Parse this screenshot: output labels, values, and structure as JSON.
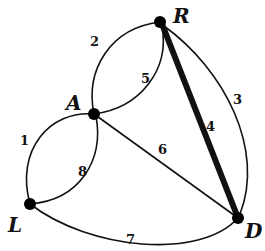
{
  "graph": {
    "nodes": [
      {
        "id": "R",
        "label": "R"
      },
      {
        "id": "A",
        "label": "A"
      },
      {
        "id": "L",
        "label": "L"
      },
      {
        "id": "D",
        "label": "D"
      }
    ],
    "edges": [
      {
        "id": "e1",
        "label": "1",
        "from": "A",
        "to": "L"
      },
      {
        "id": "e2",
        "label": "2",
        "from": "A",
        "to": "R"
      },
      {
        "id": "e3",
        "label": "3",
        "from": "R",
        "to": "D"
      },
      {
        "id": "e4",
        "label": "4",
        "from": "R",
        "to": "D",
        "highlighted": true
      },
      {
        "id": "e5",
        "label": "5",
        "from": "A",
        "to": "R"
      },
      {
        "id": "e6",
        "label": "6",
        "from": "A",
        "to": "D"
      },
      {
        "id": "e7",
        "label": "7",
        "from": "L",
        "to": "D"
      },
      {
        "id": "e8",
        "label": "8",
        "from": "A",
        "to": "L"
      }
    ]
  }
}
